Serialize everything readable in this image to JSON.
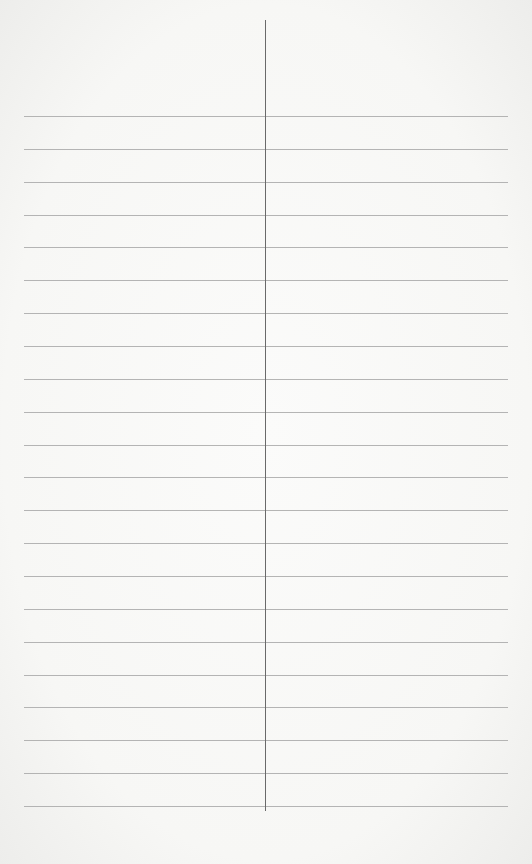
{
  "page": {
    "type": "ruled-two-column-sheet",
    "line_count": 22,
    "first_line_y": 116,
    "line_spacing": 32.86,
    "line_left": 24,
    "line_width": 484,
    "divider_x": 265,
    "divider_top": 20,
    "divider_bottom": 811,
    "colors": {
      "paper": "#f7f7f5",
      "rule": "#a8a8a8",
      "divider": "#6a6a6a"
    }
  }
}
